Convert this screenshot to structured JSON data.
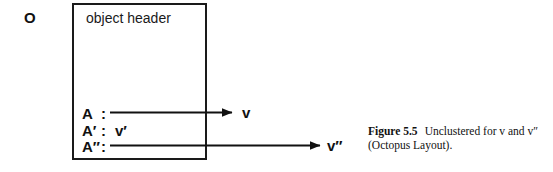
{
  "diagram": {
    "object_label": "O",
    "box": {
      "header": "object header",
      "attributes": [
        {
          "name": "A",
          "colon": ":",
          "value": "",
          "has_pointer": true,
          "pointer_target": "v"
        },
        {
          "name": "A′",
          "colon": ":",
          "value": "v′",
          "has_pointer": false,
          "pointer_target": ""
        },
        {
          "name": "A″",
          "colon": ":",
          "value": "",
          "has_pointer": true,
          "pointer_target": "v″"
        }
      ]
    },
    "pointer_targets": [
      {
        "label": "v"
      },
      {
        "label": "v″"
      }
    ]
  },
  "caption": {
    "number": "Figure 5.5",
    "line_1_text": "Unclustered for v and v″",
    "line_2": "(Octopus Layout)."
  },
  "colors": {
    "background": "#ffffff",
    "ink": "#111111",
    "box_border": "#1a1a1a"
  }
}
